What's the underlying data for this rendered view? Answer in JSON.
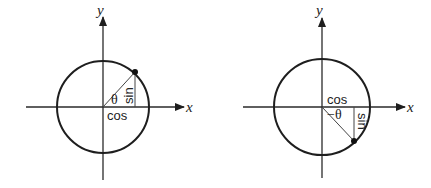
{
  "diagrams": [
    {
      "name": "positive-angle",
      "x_axis_label": "x",
      "y_axis_label": "y",
      "angle_label": "θ",
      "cos_label": "cos",
      "sin_label": "sin",
      "point_quadrant": "I"
    },
    {
      "name": "negative-angle",
      "x_axis_label": "x",
      "y_axis_label": "y",
      "angle_label": "−θ",
      "cos_label": "cos",
      "sin_label": "sin",
      "point_quadrant": "IV"
    }
  ],
  "colors": {
    "line": "#1e1e1e",
    "background": "#ffffff"
  }
}
